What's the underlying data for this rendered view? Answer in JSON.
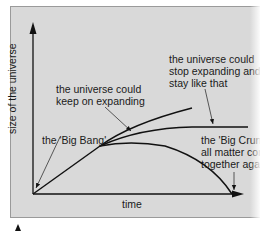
{
  "diagram": {
    "axes": {
      "y_label": "size of the universe",
      "x_label": "time"
    },
    "annotations": {
      "big_bang": "the 'Big Bang'",
      "keep_expanding": "the universe could\nkeep on expanding",
      "stop_expanding": "the universe could\nstop expanding and\nstay like that",
      "big_crunch": "the 'Big Crunch'\nall matter comes\ntogether again"
    },
    "curves": [
      {
        "name": "keep-expanding",
        "description": "continues rising"
      },
      {
        "name": "stop-expanding",
        "description": "levels off horizontally"
      },
      {
        "name": "big-crunch",
        "description": "falls back to zero size"
      }
    ],
    "colors": {
      "panel_background": "#d9d9d9",
      "line": "#111111",
      "text": "#1a1a1a"
    }
  }
}
